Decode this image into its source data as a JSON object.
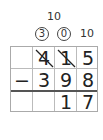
{
  "borrow_notes": {
    "top_ten": "10",
    "circled_hundreds": "3",
    "circled_tens": "0",
    "ones_ten": "10"
  },
  "problem": {
    "minuend": [
      "4",
      "1",
      "5"
    ],
    "operator": "−",
    "subtrahend": [
      "3",
      "9",
      "8"
    ],
    "result": [
      "",
      "1",
      "7"
    ]
  },
  "crossed_out_digits": [
    "4",
    "1"
  ]
}
